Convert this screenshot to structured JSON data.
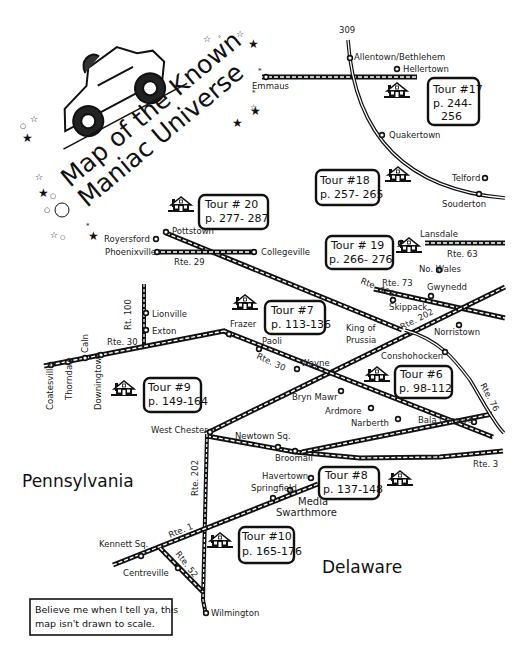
{
  "title": {
    "line1": "Map of the Known",
    "line2": "Maniac Universe"
  },
  "states": {
    "pennsylvania": "Pennsylvania",
    "delaware": "Delaware"
  },
  "note": {
    "line1": "Believe me when I tell ya, this",
    "line2": "map isn't drawn to scale."
  },
  "tours": [
    {
      "id": "17",
      "label": "Tour #17",
      "pages_l1": "p. 244-",
      "pages_l2": "256"
    },
    {
      "id": "18",
      "label": "Tour #18",
      "pages": "p. 257- 265"
    },
    {
      "id": "20",
      "label": "Tour # 20",
      "pages": "p. 277- 287"
    },
    {
      "id": "19",
      "label": "Tour # 19",
      "pages": "p. 266- 276"
    },
    {
      "id": "7",
      "label": "Tour #7",
      "pages": "p. 113-136"
    },
    {
      "id": "9",
      "label": "Tour #9",
      "pages": "p. 149-164"
    },
    {
      "id": "6",
      "label": "Tour #6",
      "pages": "p. 98-112"
    },
    {
      "id": "8",
      "label": "Tour #8",
      "pages": "p. 137-148"
    },
    {
      "id": "10",
      "label": "Tour #10",
      "pages": "p. 165-176"
    }
  ],
  "routes": {
    "r309": "309",
    "r29": "Rte. 29",
    "r422": "Rte. 422",
    "r63": "Rte. 63",
    "r73": "Rte. 73",
    "r202a": "Rte. 202",
    "r100": "Rt. 100",
    "r30a": "Rte. 30",
    "r30b": "Rte. 30",
    "r76": "Rte. 76",
    "r3": "Rte. 3",
    "r202b": "Rte. 202",
    "r1": "Rte. 1",
    "r52": "Rte. 52"
  },
  "towns": {
    "allentown": "Allentown/Bethlehem",
    "hellertown": "Hellertown",
    "emmaus": "Emmaus",
    "quakertown": "Quakertown",
    "telford": "Telford",
    "souderton": "Souderton",
    "pottstown": "Pottstown",
    "royersford": "Royersford",
    "phoenixville": "Phoenixville",
    "collegeville": "Collegeville",
    "lansdale": "Lansdale",
    "nowales": "No. Wales",
    "gwynedd": "Gwynedd",
    "skippack": "Skippack",
    "norristown": "Norristown",
    "kingof": "King of",
    "prussia": "Prussia",
    "lionville": "Lionville",
    "exton": "Exton",
    "frazer": "Frazer",
    "paoli": "Paoli",
    "wayne": "Wayne",
    "conshohocken": "Conshohocken",
    "brynmawr": "Bryn Mawr",
    "ardmore": "Ardmore",
    "narberth": "Narberth",
    "balacynwyd": "Bala Cynwyd",
    "coatesville": "Coatesville",
    "thorndale": "Thorndale",
    "caln": "Caln",
    "downingtown": "Downingtown",
    "westchester": "West Chester",
    "newtownsq": "Newtown Sq.",
    "broomall": "Broomall",
    "havertown": "Havertown",
    "springfield": "Springfield",
    "media": "Media",
    "swarthmore": "Swarthmore",
    "kennettsq": "Kennett Sq.",
    "centreville": "Centreville",
    "wilmington": "Wilmington"
  },
  "colors": {
    "ink": "#111111",
    "paper": "#ffffff"
  }
}
